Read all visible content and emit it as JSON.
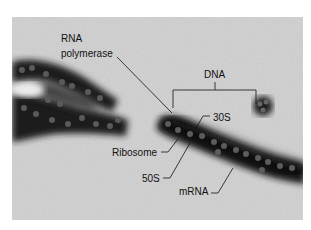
{
  "figure": {
    "type": "electron micrograph",
    "background_color": "#cfcfcf",
    "strand_color": "#1a1a1a",
    "labels": {
      "rna_polymerase_line1": "RNA",
      "rna_polymerase_line2": "polymerase",
      "dna": "DNA",
      "small_subunit": "30S",
      "ribosome": "Ribosome",
      "large_subunit": "50S",
      "mrna": "mRNA"
    }
  }
}
